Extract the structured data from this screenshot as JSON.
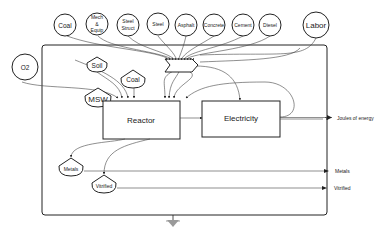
{
  "diagram": {
    "sources_top": [
      {
        "label": "Coal",
        "cx": 65,
        "cy": 25
      },
      {
        "label": "Mech & Equip",
        "line1": "Mech",
        "line2": "&",
        "line3": "Equip",
        "cx": 97,
        "cy": 24
      },
      {
        "label": "Steel Struct",
        "line1": "Steel",
        "line2": "Struct",
        "cx": 128,
        "cy": 25
      },
      {
        "label": "Steel",
        "cx": 158,
        "cy": 24
      },
      {
        "label": "Asphalt",
        "cx": 186,
        "cy": 25
      },
      {
        "label": "Concrete",
        "cx": 214,
        "cy": 25
      },
      {
        "label": "Cement",
        "cx": 243,
        "cy": 25
      },
      {
        "label": "Diesel",
        "cx": 270,
        "cy": 25
      },
      {
        "label": "Labor",
        "cx": 316,
        "cy": 25
      }
    ],
    "source_left": {
      "label": "O2"
    },
    "storages": {
      "soil": "Soil",
      "coal": "Coal",
      "msw": "MSW",
      "metals": "Metals",
      "vitrified": "Vitrified"
    },
    "processes": {
      "reactor": "Reactor",
      "electricity": "Electricity"
    },
    "outputs": {
      "energy": "Joules of energy",
      "metals": "Metals",
      "vitrified": "Vitrified"
    },
    "colors": {
      "stroke": "#222222",
      "flow": "#444444",
      "heat_sink": "#9a9a9a"
    }
  }
}
